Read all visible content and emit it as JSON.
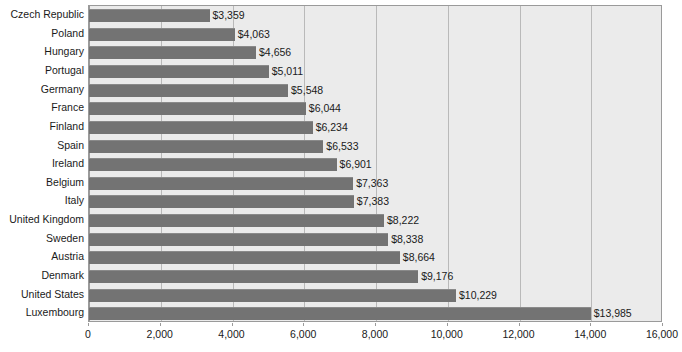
{
  "chart_data": {
    "type": "bar",
    "orientation": "horizontal",
    "title": "",
    "subtitle": "",
    "xlabel": "",
    "ylabel": "",
    "xlim": [
      0,
      16000
    ],
    "xticks": [
      0,
      2000,
      4000,
      6000,
      8000,
      10000,
      12000,
      14000,
      16000
    ],
    "xtick_labels": [
      "0",
      "2,000",
      "4,000",
      "6,000",
      "8,000",
      "10,000",
      "12,000",
      "14,000",
      "16,000"
    ],
    "grid": true,
    "grid_axis": "x",
    "legend": false,
    "legend_position": "none",
    "value_label_prefix": "$",
    "categories": [
      "Czech Republic",
      "Poland",
      "Hungary",
      "Portugal",
      "Germany",
      "France",
      "Finland",
      "Spain",
      "Ireland",
      "Belgium",
      "Italy",
      "United Kingdom",
      "Sweden",
      "Austria",
      "Denmark",
      "United States",
      "Luxembourg"
    ],
    "values": [
      3359,
      4063,
      4656,
      5011,
      5548,
      6044,
      6234,
      6533,
      6901,
      7363,
      7383,
      8222,
      8338,
      8664,
      9176,
      10229,
      13985
    ],
    "value_labels": [
      "$3,359",
      "$4,063",
      "$4,656",
      "$5,011",
      "$5,548",
      "$6,044",
      "$6,234",
      "$6,533",
      "$6,901",
      "$7,363",
      "$7,383",
      "$8,222",
      "$8,338",
      "$8,664",
      "$9,176",
      "$10,229",
      "$13,985"
    ],
    "colors": {
      "bar": "#737373",
      "bar_highlight": "#8a8a8a",
      "plot_background": "#ebebeb",
      "page_background": "#ffffff",
      "gridline": "#b9b9b9",
      "axis_line": "#9a9a9a",
      "text": "#1a1a1a"
    }
  }
}
